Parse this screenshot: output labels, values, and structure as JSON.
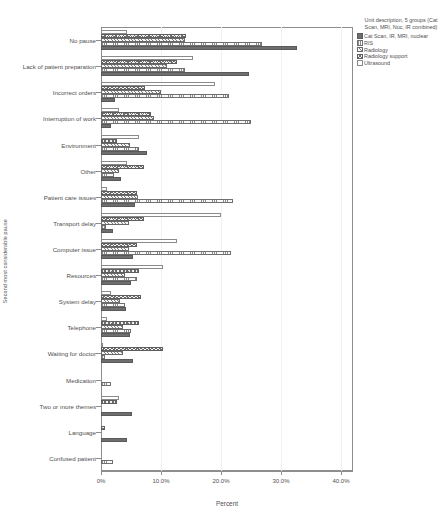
{
  "chart_data": {
    "type": "bar",
    "orientation": "horizontal",
    "title": "",
    "xlabel": "Percent",
    "ylabel": "Second most considerable pause",
    "xlim": [
      0,
      42
    ],
    "xticks": [
      0,
      10,
      20,
      30,
      40
    ],
    "xtick_labels": [
      "0%",
      "10.0%",
      "20.0%",
      "30.0%",
      "40.0%"
    ],
    "grid": true,
    "legend_position": "right",
    "legend_title": "Unit description, 5 groups (Cat Scan, MRI, Nuc, IR combined)",
    "categories": [
      "No pause",
      "Lack of patient preparation",
      "Incorrect orders",
      "Interruption of work",
      "Environment",
      "Other",
      "Patient care issues",
      "Transport delay",
      "Computer issue",
      "Resources",
      "System delay",
      "Telephone",
      "Waiting for doctor",
      "Medication",
      "Two or more themes",
      "Language",
      "Confused patient"
    ],
    "series": [
      {
        "name": "Cat Scan, IR, MRI, nuclear",
        "pattern": "solid-dark",
        "color": "#6e6e6e",
        "values": [
          32.6,
          24.6,
          2.4,
          1.6,
          7.6,
          3.4,
          5.6,
          2.0,
          5.4,
          5.0,
          4.2,
          4.8,
          5.4,
          0.0,
          5.2,
          4.4,
          0.0
        ]
      },
      {
        "name": "RIS",
        "pattern": "fine-grid",
        "color": "#fafafa",
        "values": [
          26.8,
          14.0,
          21.4,
          25.0,
          6.4,
          2.2,
          22.0,
          0.8,
          21.6,
          6.0,
          4.0,
          5.0,
          0.6,
          1.6,
          0.0,
          0.0,
          2.0
        ]
      },
      {
        "name": "Radiology",
        "pattern": "diagonal-hatch",
        "color": "#f7f7f7",
        "values": [
          14.0,
          11.0,
          10.0,
          8.8,
          4.8,
          3.0,
          6.2,
          4.6,
          4.6,
          4.0,
          3.2,
          3.6,
          3.6,
          0.0,
          0.0,
          0.0,
          0.0
        ]
      },
      {
        "name": "Radiology support",
        "pattern": "cross-hatch",
        "color": "#f2f2f2",
        "values": [
          14.2,
          12.6,
          7.4,
          8.4,
          2.6,
          7.2,
          6.0,
          7.2,
          6.0,
          6.4,
          6.6,
          6.4,
          10.4,
          0.0,
          2.6,
          0.6,
          0.0
        ]
      },
      {
        "name": "Ultrasound",
        "pattern": "open-outline",
        "color": "#ffffff",
        "values": [
          4.4,
          15.4,
          19.0,
          3.0,
          6.4,
          4.4,
          1.0,
          20.0,
          12.6,
          10.4,
          1.6,
          1.0,
          0.4,
          0.0,
          3.0,
          0.0,
          0.0
        ]
      }
    ]
  }
}
